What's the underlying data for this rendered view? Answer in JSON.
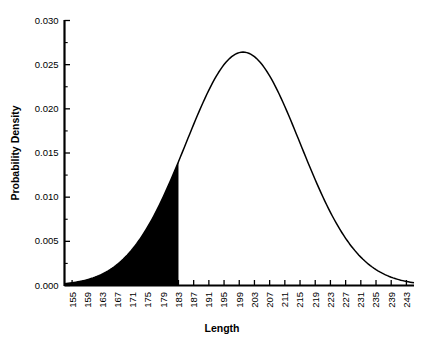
{
  "chart_data": {
    "type": "line",
    "title": "",
    "xlabel": "Length",
    "ylabel": "Probability Density",
    "xlim": [
      153,
      245
    ],
    "ylim": [
      0.0,
      0.03
    ],
    "grid": false,
    "legend": null,
    "distribution": {
      "kind": "normal",
      "mean": 200,
      "sd": 15.1
    },
    "shaded_region": {
      "label": "left tail shaded",
      "from": 153,
      "to": 183,
      "fill_color": "#000000",
      "density_at_upper_bound": 0.0154
    },
    "xticks": [
      155,
      159,
      163,
      167,
      171,
      175,
      179,
      183,
      187,
      191,
      195,
      199,
      203,
      207,
      211,
      215,
      219,
      223,
      227,
      231,
      235,
      239,
      243
    ],
    "xtick_labels": [
      "155",
      "159",
      "163",
      "167",
      "171",
      "175",
      "179",
      "183",
      "187",
      "191",
      "195",
      "199",
      "203",
      "207",
      "211",
      "215",
      "219",
      "223",
      "227",
      "231",
      "235",
      "239",
      "243"
    ],
    "yticks": [
      0.0,
      0.005,
      0.01,
      0.015,
      0.02,
      0.025,
      0.03
    ],
    "ytick_labels": [
      "0.000",
      "0.005",
      "0.010",
      "0.015",
      "0.020",
      "0.025",
      "0.030"
    ],
    "yticks_minor": [
      0.0025,
      0.0075,
      0.0125,
      0.0175,
      0.0225,
      0.0275
    ],
    "x": [
      153,
      155,
      157,
      159,
      161,
      163,
      165,
      167,
      169,
      171,
      173,
      175,
      177,
      179,
      181,
      183,
      185,
      187,
      189,
      191,
      193,
      195,
      197,
      199,
      201,
      203,
      205,
      207,
      209,
      211,
      213,
      215,
      217,
      219,
      221,
      223,
      225,
      227,
      229,
      231,
      233,
      235,
      237,
      239,
      241,
      243,
      245
    ],
    "y": [
      0.00079,
      0.00112,
      0.00155,
      0.00211,
      0.00281,
      0.00367,
      0.0047,
      0.0059,
      0.00725,
      0.00873,
      0.01029,
      0.01189,
      0.01345,
      0.01491,
      0.01619,
      0.01722,
      0.01794,
      0.01832,
      0.01832,
      0.01794,
      0.01722,
      0.01619,
      0.01491,
      0.01345,
      0.01189,
      0.01029,
      0.00873,
      0.00725,
      0.0059,
      0.0047,
      0.00367,
      0.00281,
      0.00211,
      0.00155,
      0.00112,
      0.00079,
      0.00055,
      0.00038,
      0.00025,
      0.00016,
      0.0001,
      6e-05,
      4e-05,
      2e-05,
      1e-05,
      1e-05,
      0.0
    ],
    "peak": {
      "x": 200,
      "y": 0.0264
    },
    "colors": {
      "line": "#000000",
      "fill": "#000000",
      "axis": "#000000",
      "background": "#ffffff"
    }
  }
}
